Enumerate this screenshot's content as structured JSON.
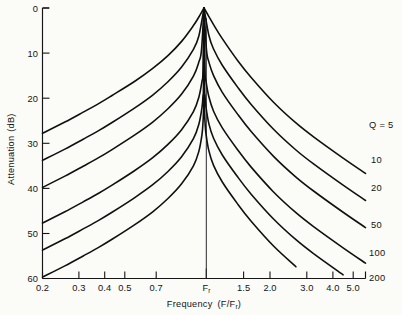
{
  "chart_data": {
    "type": "line",
    "title": "",
    "xlabel": "Frequency  (F/Fr)",
    "ylabel": "Attenuation  (dB)",
    "x_scale": "log",
    "xlim": [
      0.2,
      5.0
    ],
    "ylim": [
      0,
      60
    ],
    "y_inverted": true,
    "grid": false,
    "legend_position": "right-of-axes",
    "xticks": [
      0.2,
      0.3,
      0.4,
      0.5,
      0.7,
      1.0,
      1.5,
      2.0,
      3.0,
      4.0,
      5.0
    ],
    "xticklabels": [
      "0.2",
      "0.3",
      "0.4",
      "0.5",
      "0.7",
      "Fr",
      "1.5",
      "2.0",
      "3.0",
      "4.0",
      "5.0"
    ],
    "yticks": [
      0,
      10,
      20,
      30,
      40,
      50,
      60
    ],
    "yticklabels": [
      "0",
      "10",
      "20",
      "30",
      "40",
      "50",
      "60"
    ],
    "annotations": [
      "Fr marker line at F/Fr = 1.0"
    ],
    "series": [
      {
        "name": "Q = 5",
        "q": 5,
        "label": "Q = 5",
        "x": [
          0.2,
          0.25,
          0.3,
          0.35,
          0.4,
          0.5,
          0.6,
          0.7,
          0.8,
          0.9,
          0.95,
          1.0,
          1.05,
          1.1,
          1.2,
          1.4,
          1.6,
          2.0,
          2.5,
          3.0,
          4.0,
          5.0
        ],
        "values": [
          27.8,
          25.3,
          23.1,
          21.2,
          19.4,
          16.3,
          13.4,
          10.5,
          7.4,
          3.9,
          2.0,
          0.0,
          1.9,
          3.7,
          6.8,
          11.7,
          15.4,
          20.9,
          25.5,
          28.7,
          33.3,
          36.7
        ]
      },
      {
        "name": "10",
        "q": 10,
        "label": "10",
        "x": [
          0.2,
          0.25,
          0.3,
          0.35,
          0.4,
          0.5,
          0.6,
          0.7,
          0.8,
          0.9,
          0.95,
          1.0,
          1.05,
          1.1,
          1.2,
          1.4,
          1.6,
          2.0,
          2.5,
          3.0,
          4.0,
          5.0
        ],
        "values": [
          33.8,
          31.3,
          29.1,
          27.2,
          25.4,
          22.2,
          19.3,
          16.3,
          13.1,
          9.2,
          6.2,
          0.0,
          6.1,
          9.1,
          12.7,
          17.6,
          21.4,
          26.9,
          31.5,
          34.7,
          39.3,
          42.7
        ]
      },
      {
        "name": "20",
        "q": 20,
        "label": "20",
        "x": [
          0.2,
          0.25,
          0.3,
          0.35,
          0.4,
          0.5,
          0.6,
          0.7,
          0.8,
          0.9,
          0.95,
          0.975,
          1.0,
          1.025,
          1.05,
          1.1,
          1.2,
          1.4,
          1.6,
          2.0,
          2.5,
          3.0,
          4.0,
          5.0
        ],
        "values": [
          39.8,
          37.3,
          35.1,
          33.2,
          31.4,
          28.2,
          25.3,
          22.3,
          19.1,
          15.1,
          12.0,
          9.4,
          0.0,
          9.3,
          12.0,
          15.0,
          18.7,
          23.6,
          27.4,
          32.9,
          37.5,
          40.7,
          45.3,
          48.7
        ]
      },
      {
        "name": "50",
        "q": 50,
        "label": "50",
        "x": [
          0.2,
          0.25,
          0.3,
          0.35,
          0.4,
          0.5,
          0.6,
          0.7,
          0.8,
          0.9,
          0.95,
          0.98,
          0.99,
          1.0,
          1.01,
          1.02,
          1.05,
          1.1,
          1.2,
          1.4,
          1.6,
          2.0,
          2.5,
          3.0,
          4.0,
          5.0
        ],
        "values": [
          47.7,
          45.2,
          43.0,
          41.1,
          39.3,
          36.1,
          33.2,
          30.2,
          27.0,
          23.0,
          19.8,
          16.3,
          13.9,
          0.0,
          13.8,
          16.2,
          19.7,
          22.9,
          26.6,
          31.5,
          35.3,
          40.8,
          45.4,
          48.6,
          53.2,
          56.6
        ]
      },
      {
        "name": "100",
        "q": 100,
        "label": "100",
        "x": [
          0.2,
          0.25,
          0.3,
          0.35,
          0.4,
          0.5,
          0.6,
          0.7,
          0.8,
          0.9,
          0.95,
          0.98,
          0.99,
          0.995,
          1.0,
          1.005,
          1.01,
          1.02,
          1.05,
          1.1,
          1.2,
          1.4,
          1.6,
          2.0,
          2.5,
          3.0,
          4.0,
          5.0
        ],
        "values": [
          53.7,
          51.2,
          49.0,
          47.1,
          45.3,
          42.1,
          39.2,
          36.2,
          33.0,
          29.0,
          25.8,
          22.1,
          19.5,
          17.1,
          0.0,
          17.0,
          19.4,
          22.0,
          25.7,
          28.9,
          32.6,
          37.5,
          41.3,
          46.8,
          51.4,
          54.6,
          59.2,
          62.6
        ]
      },
      {
        "name": "200",
        "q": 200,
        "label": "200",
        "x": [
          0.2,
          0.25,
          0.3,
          0.35,
          0.4,
          0.5,
          0.6,
          0.7,
          0.8,
          0.9,
          0.95,
          0.98,
          0.99,
          0.995,
          0.998,
          1.0,
          1.002,
          1.005,
          1.01,
          1.02,
          1.05,
          1.1,
          1.2,
          1.4,
          1.6,
          2.0,
          2.5,
          3.0,
          3.5,
          4.0,
          4.5,
          5.0
        ],
        "values": [
          59.7,
          57.2,
          55.0,
          53.1,
          51.3,
          48.1,
          45.2,
          42.2,
          39.0,
          35.0,
          31.8,
          28.1,
          25.4,
          23.0,
          20.0,
          0.0,
          19.9,
          22.9,
          25.3,
          27.9,
          31.7,
          34.9,
          38.6,
          43.5,
          47.3,
          52.8,
          57.4,
          60.6,
          63.0,
          65.2,
          67.0,
          68.6
        ]
      }
    ]
  },
  "axes": {
    "ylabel_main": "Attenuation",
    "ylabel_unit": "(dB)",
    "xlabel_main": "Frequency",
    "xlabel_unit_pre": "(F/F",
    "xlabel_unit_sub": "r",
    "xlabel_unit_post": ")",
    "fr_tick_main": "F",
    "fr_tick_sub": "r"
  },
  "colors": {
    "ink": "#141414",
    "paper": "#fbfbf8",
    "curve": "#101010"
  }
}
